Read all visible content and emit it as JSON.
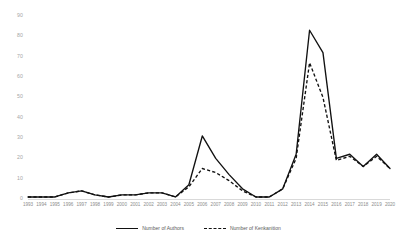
{
  "chart_data": {
    "type": "line",
    "title": "",
    "xlabel": "",
    "ylabel": "",
    "ylim": [
      0,
      90
    ],
    "ytick_values": [
      90,
      80,
      70,
      60,
      50,
      40,
      30,
      20,
      10,
      0
    ],
    "grid": false,
    "legend_position": "bottom",
    "categories": [
      "1993",
      "1994",
      "1995",
      "1996",
      "1997",
      "1998",
      "1999",
      "2000",
      "2001",
      "2002",
      "2003",
      "2004",
      "2005",
      "2006",
      "2007",
      "2008",
      "2009",
      "2010",
      "2011",
      "2012",
      "2013",
      "2014",
      "2015",
      "2016",
      "2017",
      "2018",
      "2019",
      "2020"
    ],
    "series": [
      {
        "name": "Number of Authors",
        "style": "solid",
        "color": "#111111",
        "values": [
          1,
          1,
          1,
          3,
          4,
          2,
          1,
          2,
          2,
          3,
          3,
          1,
          7,
          31,
          20,
          12,
          5,
          1,
          1,
          5,
          22,
          83,
          72,
          20,
          22,
          16,
          22,
          15
        ]
      },
      {
        "name": "Number of Kenkanition",
        "style": "dashed",
        "color": "#111111",
        "values": [
          1,
          1,
          1,
          3,
          4,
          2,
          1,
          2,
          2,
          3,
          3,
          1,
          6,
          15,
          13,
          9,
          4,
          1,
          1,
          5,
          20,
          67,
          50,
          19,
          21,
          16,
          21,
          15
        ]
      }
    ]
  },
  "legend": {
    "items": [
      {
        "label": "Number of Authors",
        "style": "solid"
      },
      {
        "label": "Number of Kenkanition",
        "style": "dashed"
      }
    ]
  }
}
